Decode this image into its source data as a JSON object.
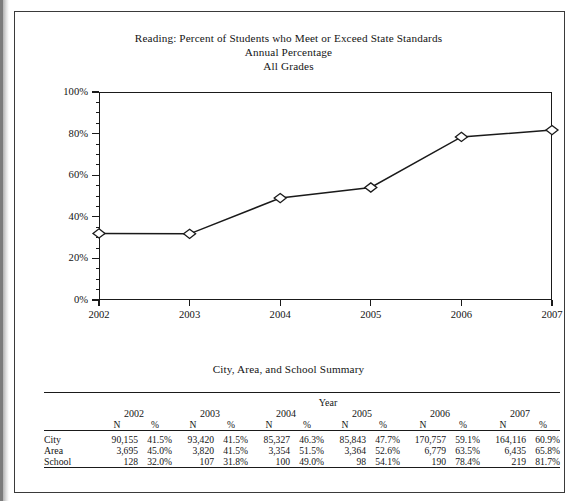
{
  "chart": {
    "title_line1": "Reading: Percent of Students who Meet or Exceed State Standards",
    "title_line2": "Annual Percentage",
    "title_line3": "All Grades"
  },
  "table": {
    "title": "City, Area, and School Summary",
    "group_header": "Year",
    "years": [
      "2002",
      "2003",
      "2004",
      "2005",
      "2006",
      "2007"
    ],
    "sub_headers": [
      "N",
      "%"
    ],
    "rows": [
      {
        "label": "City",
        "cells": [
          {
            "n": "90,155",
            "pct": "41.5%"
          },
          {
            "n": "93,420",
            "pct": "41.5%"
          },
          {
            "n": "85,327",
            "pct": "46.3%"
          },
          {
            "n": "85,843",
            "pct": "47.7%"
          },
          {
            "n": "170,757",
            "pct": "59.1%"
          },
          {
            "n": "164,116",
            "pct": "60.9%"
          }
        ]
      },
      {
        "label": "Area",
        "cells": [
          {
            "n": "3,695",
            "pct": "45.0%"
          },
          {
            "n": "3,820",
            "pct": "41.5%"
          },
          {
            "n": "3,354",
            "pct": "51.5%"
          },
          {
            "n": "3,364",
            "pct": "52.6%"
          },
          {
            "n": "6,779",
            "pct": "63.5%"
          },
          {
            "n": "6,435",
            "pct": "65.8%"
          }
        ]
      },
      {
        "label": "School",
        "cells": [
          {
            "n": "128",
            "pct": "32.0%"
          },
          {
            "n": "107",
            "pct": "31.8%"
          },
          {
            "n": "100",
            "pct": "49.0%"
          },
          {
            "n": "98",
            "pct": "54.1%"
          },
          {
            "n": "190",
            "pct": "78.4%"
          },
          {
            "n": "219",
            "pct": "81.7%"
          }
        ]
      }
    ]
  },
  "chart_data": {
    "type": "line",
    "title": "Reading: Percent of Students who Meet or Exceed State Standards Annual Percentage All Grades",
    "xlabel": "",
    "ylabel": "",
    "x": [
      "2002",
      "2003",
      "2004",
      "2005",
      "2006",
      "2007"
    ],
    "series": [
      {
        "name": "School",
        "values": [
          32.0,
          31.8,
          49.0,
          54.1,
          78.4,
          81.7
        ],
        "marker": "open-diamond",
        "color": "#1a1a1a"
      }
    ],
    "ylim": [
      0,
      100
    ],
    "ytick_labels": [
      "0%",
      "20%",
      "40%",
      "60%",
      "80%",
      "100%"
    ],
    "ytick_values": [
      0,
      20,
      40,
      60,
      80,
      100
    ],
    "yminor_step": 5,
    "xtick_labels": [
      "2002",
      "2003",
      "2004",
      "2005",
      "2006",
      "2007"
    ],
    "grid": false,
    "legend": "none"
  }
}
